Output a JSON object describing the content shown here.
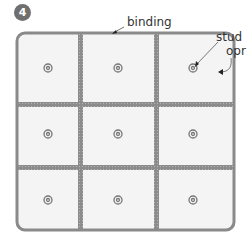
{
  "step": {
    "number": "4"
  },
  "labels": {
    "binding": "binding",
    "stud": "stud",
    "opr": "opr"
  },
  "quilt": {
    "grid": "3x3",
    "blocks": 9,
    "studs_per_block": 1,
    "colors": {
      "binding": "#8a8a8a",
      "sashing": "#8c8c8c",
      "block_fill": "#f4f4f4",
      "stud": "#777777"
    }
  }
}
